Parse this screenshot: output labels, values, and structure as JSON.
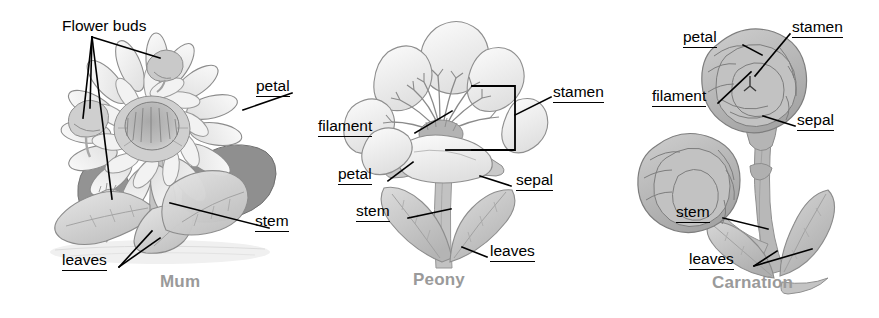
{
  "figure": {
    "background_color": "#ffffff",
    "label_color": "#000000",
    "caption_color": "#9a9a9a"
  },
  "panels": [
    {
      "id": "mum",
      "caption": "Mum",
      "labels": [
        {
          "name": "flower-buds",
          "text": "Flower buds",
          "underlined": false
        },
        {
          "name": "petal",
          "text": "petal",
          "underlined": true
        },
        {
          "name": "stem",
          "text": "stem",
          "underlined": true
        },
        {
          "name": "leaves",
          "text": "leaves",
          "underlined": true
        }
      ]
    },
    {
      "id": "peony",
      "caption": "Peony",
      "labels": [
        {
          "name": "filament",
          "text": "filament",
          "underlined": true
        },
        {
          "name": "petal",
          "text": "petal",
          "underlined": true
        },
        {
          "name": "stamen",
          "text": "stamen",
          "underlined": true
        },
        {
          "name": "sepal",
          "text": "sepal",
          "underlined": true
        },
        {
          "name": "stem",
          "text": "stem",
          "underlined": true
        },
        {
          "name": "leaves",
          "text": "leaves",
          "underlined": true
        }
      ]
    },
    {
      "id": "carnation",
      "caption": "Carnation",
      "labels": [
        {
          "name": "petal",
          "text": "petal",
          "underlined": true
        },
        {
          "name": "stamen",
          "text": "stamen",
          "underlined": true
        },
        {
          "name": "filament",
          "text": "filament",
          "underlined": true
        },
        {
          "name": "sepal",
          "text": "sepal",
          "underlined": true
        },
        {
          "name": "stem",
          "text": "stem",
          "underlined": true
        },
        {
          "name": "leaves",
          "text": "leaves",
          "underlined": true
        }
      ]
    }
  ]
}
